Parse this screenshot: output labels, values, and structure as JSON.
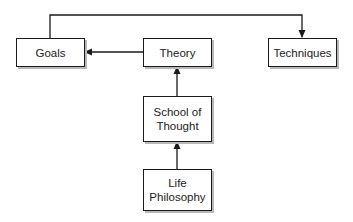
{
  "diagram": {
    "type": "flowchart",
    "nodes": {
      "goals": {
        "label": "Goals"
      },
      "theory": {
        "label": "Theory"
      },
      "techniques": {
        "label": "Techniques"
      },
      "school": {
        "line1": "School of",
        "line2": "Thought"
      },
      "life": {
        "line1": "Life",
        "line2": "Philosophy"
      }
    },
    "edges": [
      {
        "from": "Life Philosophy",
        "to": "School of Thought"
      },
      {
        "from": "School of Thought",
        "to": "Theory"
      },
      {
        "from": "Theory",
        "to": "Goals"
      },
      {
        "from": "Goals",
        "to": "Techniques"
      }
    ],
    "colors": {
      "stroke": "#1a1a1a",
      "shadow": "#b8b8b8",
      "text": "#222222",
      "background": "#ffffff"
    }
  }
}
